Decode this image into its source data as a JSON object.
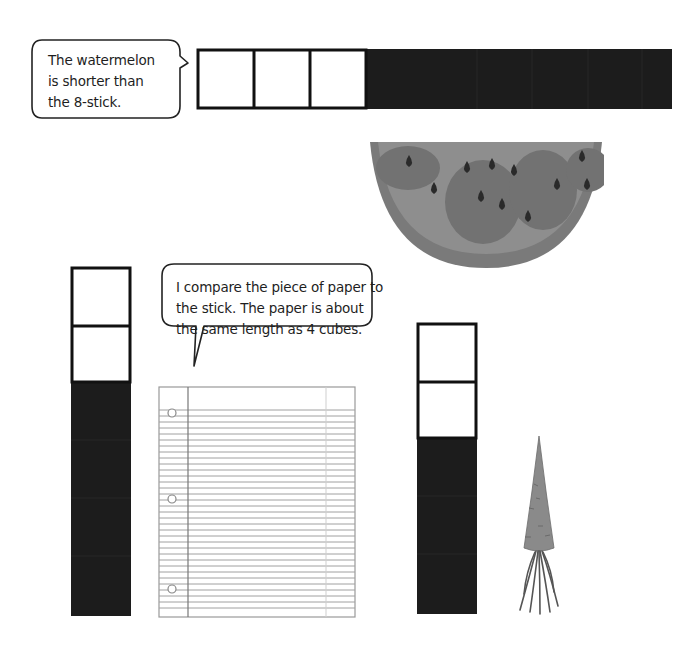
{
  "bubbles": {
    "watermelon": {
      "lines": [
        "The watermelon",
        "is shorter than",
        "the 8-stick."
      ]
    },
    "paper": {
      "lines": [
        "I compare the piece of paper to",
        "the stick.  The paper is about",
        "the same length as 4 cubes."
      ]
    }
  },
  "sticks": {
    "horizontal": {
      "total_cubes": 8,
      "white_cubes": 3,
      "dark_cubes": 5
    },
    "vertical_left": {
      "total_cubes": 6,
      "white_cubes": 2,
      "dark_cubes": 4
    },
    "vertical_right": {
      "total_cubes": 5,
      "white_cubes": 2,
      "dark_cubes": 3
    }
  },
  "objects": {
    "watermelon": "watermelon-slice",
    "paper": "lined-notebook-paper",
    "carrot": "carrot"
  },
  "colors": {
    "cube_dark": "#1c1c1c",
    "cube_border": "#111111",
    "watermelon_rind": "#7a7a7a",
    "watermelon_flesh": "#8e8e8e",
    "watermelon_patch": "#707070",
    "seed": "#2a2a2a",
    "paper_line": "#9a9a9a",
    "carrot": "#8a8a8a"
  }
}
